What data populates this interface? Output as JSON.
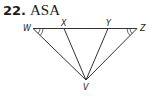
{
  "problem": {
    "number": "22.",
    "title": "ASA"
  },
  "diagram": {
    "points": {
      "W": "W",
      "X": "X",
      "Y": "Y",
      "Z": "Z",
      "V": "V"
    },
    "segments": [
      "WZ",
      "WV",
      "XV",
      "YV",
      "ZV"
    ],
    "congruent_angle_marks": [
      "angle-W",
      "angle-Z"
    ],
    "angle_mark_style": "double-arc",
    "line_color": "#333333"
  }
}
